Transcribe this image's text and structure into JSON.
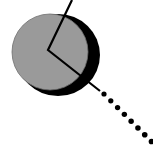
{
  "figure": {
    "type": "geometric-diagram",
    "canvas": {
      "width": 153,
      "height": 148,
      "background": "#ffffff"
    },
    "colors": {
      "disc_fill": "#9a9a9a",
      "shadow_fill": "#000000",
      "stroke": "#000000",
      "dot_fill": "#000000",
      "background": "#ffffff"
    },
    "shapes": {
      "shadow_disc": {
        "label": "shadow-disc",
        "cx": 58,
        "cy": 55,
        "rx": 42,
        "ry": 41
      },
      "main_disc": {
        "label": "main-disc",
        "cx": 50,
        "cy": 52,
        "rx": 38,
        "ry": 38,
        "fill": "#9a9a9a"
      },
      "angle_polyline": {
        "label": "angle-polyline",
        "points": "72,0 48,50 100,91",
        "stroke_width": 2.2,
        "vertex": {
          "x": 48,
          "y": 50
        }
      },
      "dotted_ray": {
        "label": "dotted-ray",
        "from": {
          "x": 104,
          "y": 94
        },
        "to": {
          "x": 153,
          "y": 143
        },
        "dot_radius": 2.6,
        "dot_count": 10,
        "dot_spacing": 9.6
      }
    },
    "annotations": {
      "caption": "",
      "legend": ""
    }
  }
}
